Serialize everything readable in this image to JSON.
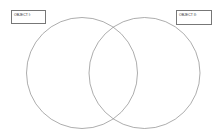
{
  "diagram": {
    "type": "venn",
    "labels": [
      {
        "text": "OBJECT I:"
      },
      {
        "text": "OBJECT II:"
      }
    ],
    "colors": {
      "stroke": "#8a8a8a",
      "box_border": "#777777",
      "background": "#ffffff"
    }
  }
}
